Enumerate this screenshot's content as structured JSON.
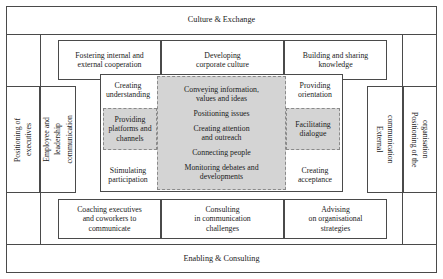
{
  "diagram": {
    "title_top": "Culture & Exchange",
    "title_bottom": "Enabling & Consulting",
    "side_left_outer": "Positioning of executives",
    "side_left_outer_lines": [
      "Positioning of",
      "executives"
    ],
    "side_left_inner_lines": [
      "Employee and",
      "leadership",
      "communication"
    ],
    "side_right_inner": "External communication",
    "side_right_inner_lines": [
      "External",
      "communication"
    ],
    "side_right_outer_lines": [
      "Positioning of the",
      "organisation"
    ],
    "top_row": [
      {
        "line1": "Fostering internal and",
        "line2": "external cooperation"
      },
      {
        "line1": "Developing",
        "line2": "corporate culture"
      },
      {
        "line1": "Building and sharing",
        "line2": "knowledge"
      }
    ],
    "bottom_row": [
      {
        "line1": "Coaching executives",
        "line2": "and coworkers to",
        "line3": "communicate"
      },
      {
        "line1": "Consulting",
        "line2": "in communication",
        "line3": "challenges"
      },
      {
        "line1": "Advising",
        "line2": "on organisational",
        "line3": "strategies"
      }
    ],
    "core": {
      "left_top": {
        "line1": "Creating",
        "line2": "understanding"
      },
      "left_mid": {
        "line1": "Providing",
        "line2": "platforms and",
        "line3": "channels"
      },
      "left_bottom": {
        "line1": "Stimulating",
        "line2": "participation"
      },
      "right_top": {
        "line1": "Providing",
        "line2": "orientation"
      },
      "right_mid": {
        "line1": "Facilitating",
        "line2": "dialogue"
      },
      "right_bottom": {
        "line1": "Creating",
        "line2": "acceptance"
      },
      "center_items": [
        {
          "line1": "Conveying information,",
          "line2": "values and ideas"
        },
        {
          "line1": "Positioning issues",
          "line2": ""
        },
        {
          "line1": "Creating attention",
          "line2": "and outreach"
        },
        {
          "line1": "Connecting people",
          "line2": ""
        },
        {
          "line1": "Monitoring debates and",
          "line2": "developments"
        }
      ]
    },
    "colors": {
      "gray_fill": "#d4d4d4",
      "border": "#4a4a4a",
      "dashed_border": "#8a8a8a",
      "background": "#ffffff"
    }
  }
}
